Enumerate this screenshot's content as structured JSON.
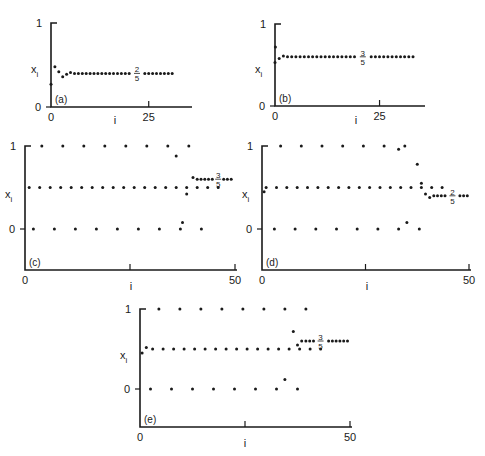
{
  "chart_data": [
    {
      "type": "scatter",
      "panel": "(a)",
      "xlabel": "i",
      "ylabel": "x_i",
      "xlim": [
        0,
        33
      ],
      "ylim": [
        0,
        1
      ],
      "x_ticks": [
        "0",
        "25"
      ],
      "y_ticks": [
        "0",
        "1"
      ],
      "annotation": {
        "text": "2/5",
        "numerator": "2",
        "denominator": "5",
        "x": 22,
        "y": 0.4
      },
      "fixed_point": 0.4,
      "points": [
        [
          0,
          0.27
        ],
        [
          1,
          0.48
        ],
        [
          2,
          0.42
        ],
        [
          3,
          0.36
        ],
        [
          4,
          0.39
        ],
        [
          5,
          0.41
        ]
      ],
      "tail": {
        "from": 6,
        "to": 31,
        "value": 0.4,
        "gap_at": 22
      }
    },
    {
      "type": "scatter",
      "panel": "(b)",
      "xlabel": "i",
      "ylabel": "x_i",
      "xlim": [
        0,
        33
      ],
      "ylim": [
        0,
        1
      ],
      "x_ticks": [
        "0",
        "25"
      ],
      "y_ticks": [
        "0",
        "1"
      ],
      "annotation": {
        "text": "3/5",
        "numerator": "3",
        "denominator": "5",
        "x": 21,
        "y": 0.6
      },
      "fixed_point": 0.6,
      "points": [
        [
          0,
          0.53
        ],
        [
          0.1,
          0.72
        ],
        [
          1,
          0.58
        ],
        [
          2,
          0.61
        ]
      ],
      "tail": {
        "from": 3,
        "to": 33,
        "value": 0.6,
        "gap_at": 21
      }
    },
    {
      "type": "scatter",
      "panel": "(c)",
      "xlabel": "i",
      "ylabel": "x_i",
      "xlim": [
        0,
        50
      ],
      "ylim": [
        -0.5,
        1
      ],
      "x_ticks": [
        "0",
        "50"
      ],
      "y_ticks": [
        "0",
        "1"
      ],
      "annotation": {
        "text": "3/5",
        "numerator": "3",
        "denominator": "5",
        "x": 46,
        "y": 0.6
      },
      "fixed_point": 0.6,
      "rows": {
        "top": {
          "value": 1.0,
          "start": 4,
          "step": 5,
          "count": 8
        },
        "mid": {
          "value": 0.5,
          "start": 1,
          "step": 2.5,
          "count": 19
        },
        "bottom": {
          "value": 0.0,
          "start": 2,
          "step": 5,
          "count": 9
        }
      },
      "points": [
        [
          36,
          0.88
        ],
        [
          37.5,
          0.08
        ],
        [
          38.5,
          0.42
        ],
        [
          40,
          0.62
        ]
      ],
      "tail": {
        "from": 41,
        "to": 49.5,
        "value": 0.6,
        "gap_at": 46
      }
    },
    {
      "type": "scatter",
      "panel": "(d)",
      "xlabel": "i",
      "ylabel": "x_i",
      "xlim": [
        0,
        50
      ],
      "ylim": [
        -0.5,
        1
      ],
      "x_ticks": [
        "0",
        "50"
      ],
      "y_ticks": [
        "0",
        "1"
      ],
      "annotation": {
        "text": "2/5",
        "numerator": "2",
        "denominator": "5",
        "x": 46,
        "y": 0.4
      },
      "fixed_point": 0.4,
      "rows": {
        "top": {
          "value": 1.0,
          "start": 4.5,
          "step": 5,
          "count": 7
        },
        "mid": {
          "value": 0.5,
          "start": 1,
          "step": 2.5,
          "count": 18
        },
        "bottom": {
          "value": 0.0,
          "start": 3,
          "step": 5,
          "count": 8
        }
      },
      "points": [
        [
          0.5,
          0.45
        ],
        [
          33,
          0.96
        ],
        [
          35,
          0.08
        ],
        [
          37.5,
          0.78
        ],
        [
          38.5,
          0.55
        ],
        [
          39.5,
          0.42
        ],
        [
          40.5,
          0.38
        ]
      ],
      "tail": {
        "from": 41.5,
        "to": 50,
        "value": 0.4,
        "gap_at": 46
      }
    },
    {
      "type": "scatter",
      "panel": "(e)",
      "xlabel": "i",
      "ylabel": "x_i",
      "xlim": [
        0,
        50
      ],
      "ylim": [
        -0.5,
        1
      ],
      "x_ticks": [
        "0",
        "50"
      ],
      "y_ticks": [
        "0",
        "1"
      ],
      "annotation": {
        "text": "3/5",
        "numerator": "3",
        "denominator": "5",
        "x": 43,
        "y": 0.6
      },
      "fixed_point": 0.6,
      "rows": {
        "top": {
          "value": 1.0,
          "start": 4.5,
          "step": 5,
          "count": 8
        },
        "mid": {
          "value": 0.5,
          "start": 3,
          "step": 2.5,
          "count": 17
        },
        "bottom": {
          "value": 0.0,
          "start": 2.5,
          "step": 5,
          "count": 8
        }
      },
      "points": [
        [
          0.5,
          0.45
        ],
        [
          1.5,
          0.52
        ],
        [
          34.5,
          0.12
        ],
        [
          36.5,
          0.72
        ],
        [
          37.5,
          0.55
        ],
        [
          38.5,
          0.6
        ]
      ],
      "tail": {
        "from": 39.5,
        "to": 49.5,
        "value": 0.6,
        "gap_at": 43
      }
    }
  ]
}
